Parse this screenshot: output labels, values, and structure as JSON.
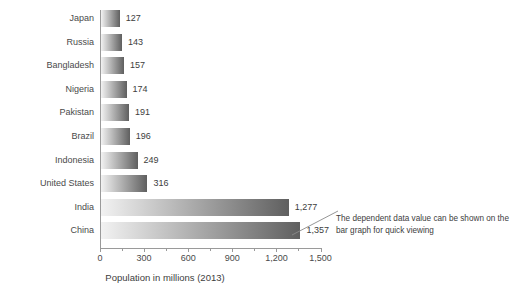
{
  "chart_data": {
    "type": "bar",
    "orientation": "horizontal",
    "title": "",
    "xlabel": "Population in millions (2013)",
    "ylabel": "",
    "xlim": [
      0,
      1500
    ],
    "xticks": [
      0,
      300,
      600,
      900,
      1200,
      1500
    ],
    "xticklabels": [
      "0",
      "300",
      "600",
      "900",
      "1,200",
      "1,500"
    ],
    "minor_tick_interval": 150,
    "grid": false,
    "legend": null,
    "categories": [
      "Japan",
      "Russia",
      "Bangladesh",
      "Nigeria",
      "Pakistan",
      "Brazil",
      "Indonesia",
      "United States",
      "India",
      "China"
    ],
    "values": [
      127,
      143,
      157,
      174,
      191,
      196,
      249,
      316,
      1277,
      1357
    ],
    "value_labels": [
      "127",
      "143",
      "157",
      "174",
      "191",
      "196",
      "249",
      "316",
      "1,277",
      "1,357"
    ],
    "bar_style": "horizontal gradient light-to-dark gray",
    "annotations": [
      {
        "text": "The dependent data value can be shown on the bar graph for quick viewing",
        "points_to": "China bar value label"
      }
    ]
  },
  "colors": {
    "background": "#ffffff",
    "axis": "#9a9a9a",
    "text": "#4a4a4a",
    "bar_light": "#f2f2f2",
    "bar_dark": "#5f5f5f",
    "annotation": "#3d3d3d"
  }
}
